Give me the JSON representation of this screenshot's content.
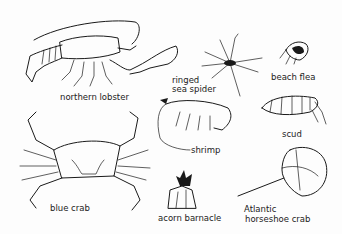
{
  "figure": {
    "labels": {
      "northern_lobster": "northern lobster",
      "ringed_sea_spider_1": "ringed",
      "ringed_sea_spider_2": "sea spider",
      "beach_flea": "beach flea",
      "scud": "scud",
      "shrimp": "shrimp",
      "blue_crab": "blue crab",
      "acorn_barnacle": "acorn barnacle",
      "horseshoe_crab_1": "Atlantic",
      "horseshoe_crab_2": "horseshoe crab"
    },
    "ink_color": "#1a1a1a",
    "background": "#fdfdfd"
  }
}
